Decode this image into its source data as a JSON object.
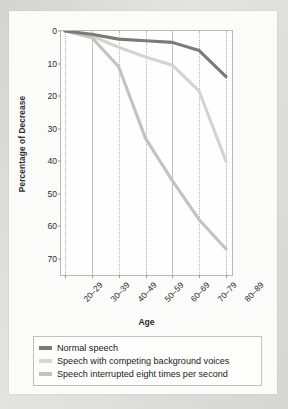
{
  "chart_data": {
    "type": "line",
    "title": "",
    "xlabel": "Age",
    "ylabel": "Percentage of Decrease",
    "categories": [
      "20–29",
      "30–39",
      "40–49",
      "50–59",
      "60–69",
      "70–79",
      "80–89"
    ],
    "ylim": [
      0,
      75
    ],
    "yticks": [
      0,
      10,
      20,
      30,
      40,
      50,
      60,
      70
    ],
    "y_axis_inverted": true,
    "grid": true,
    "legend_position": "bottom",
    "series": [
      {
        "name": "Normal speech",
        "color": "#7a7a78",
        "values": [
          0,
          1,
          2.5,
          3,
          3.5,
          6,
          14
        ]
      },
      {
        "name": "Speech with competing background voices",
        "color": "#d3d3d1",
        "values": [
          0,
          1.5,
          5,
          8,
          10.5,
          18.5,
          40
        ]
      },
      {
        "name": "Speech interrupted eight times per second",
        "color": "#c2c2c0",
        "values": [
          0,
          2,
          11,
          33,
          46,
          58,
          67
        ]
      }
    ]
  },
  "legend": {
    "items": [
      {
        "label": "Normal speech",
        "swatch": "#7a7a78"
      },
      {
        "label": "Speech with competing background voices",
        "swatch": "#d6d6d4"
      },
      {
        "label": "Speech interrupted eight times per second",
        "swatch": "#c2c2c0"
      }
    ]
  }
}
